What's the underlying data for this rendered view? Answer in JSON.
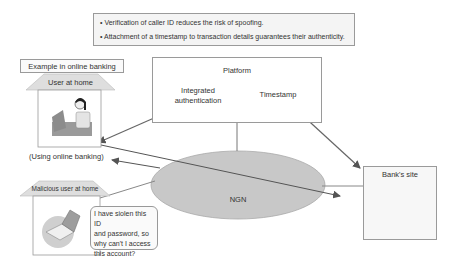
{
  "notes": {
    "items": [
      "• Verification of caller ID reduces the risk of spoofing.",
      "• Attachment of a timestamp to transaction details guarantees their authenticity."
    ]
  },
  "example_label": "Example in online banking",
  "platform": {
    "title": "Platform",
    "components": [
      {
        "label_line1": "Integrated",
        "label_line2": "authentication"
      },
      {
        "label_line1": "Timestamp"
      }
    ]
  },
  "user_home": {
    "label": "User at home",
    "caption": "(Using online banking)",
    "icon": "woman-at-laptop-icon"
  },
  "malicious_home": {
    "label": "Malicious user at home",
    "icon": "laptop-icon",
    "speech": [
      "I have siolen this ID",
      "and password, so",
      "why can't I access",
      "this account?"
    ]
  },
  "network": {
    "label": "NGN"
  },
  "bank": {
    "title": "Bank's site",
    "icon": "bank-building-icon"
  },
  "colors": {
    "arrow": "#6b6b6b",
    "cylinder": "#b8b8b8",
    "ellipse": "#c8c8c8",
    "roof": "#dedede",
    "border": "#9a9a9a"
  }
}
